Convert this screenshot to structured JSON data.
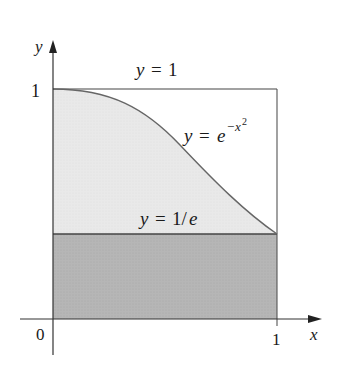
{
  "figure": {
    "axes": {
      "x_label": "x",
      "y_label": "y",
      "origin_label": "0",
      "x_tick_label": "1",
      "y_tick_label": "1"
    },
    "curves": {
      "top_line": {
        "prefix": "y",
        "eq": "=",
        "rhs": "1"
      },
      "gaussian": {
        "prefix": "y",
        "eq": "=",
        "base": "e",
        "exp_sign": "−",
        "exp_var": "x",
        "exp_pow": "2"
      },
      "bottom_line": {
        "prefix": "y",
        "eq": "=",
        "rhs_num": "1/",
        "rhs_e": "e"
      }
    },
    "colors": {
      "light_region": "#e8e8e8",
      "dark_region": "#b4b4b4",
      "lines": "#555555",
      "axes": "#333333"
    }
  }
}
